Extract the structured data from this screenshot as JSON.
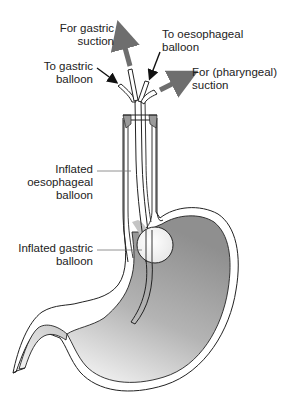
{
  "diagram": {
    "labels": {
      "gastric_suction": [
        "For gastric",
        "suction"
      ],
      "oesophageal_balloon_port": [
        "To oesophageal",
        "balloon"
      ],
      "gastric_balloon_port": [
        "To gastric",
        "balloon"
      ],
      "pharyngeal_suction": [
        "For (pharyngeal)",
        "suction"
      ],
      "inflated_oesophageal": [
        "Inflated",
        "oesophageal",
        "balloon"
      ],
      "inflated_gastric": [
        "Inflated gastric",
        "balloon"
      ]
    },
    "colors": {
      "outline": "#222222",
      "stomach_fill_dark": "#9a9a9a",
      "stomach_fill_light": "#e4e4e4",
      "arrow_grey": "#6e6e6e",
      "arrow_black": "#111111",
      "leader_line": "#777777"
    }
  }
}
